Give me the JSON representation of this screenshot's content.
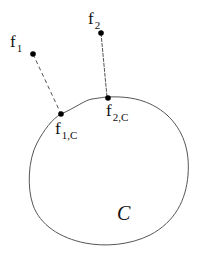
{
  "diagram": {
    "set_label": "C",
    "points": [
      {
        "name": "f",
        "sub": "1",
        "x": 33,
        "y": 54
      },
      {
        "name": "f",
        "sub": "2",
        "x": 101,
        "y": 33
      },
      {
        "name": "f",
        "sub": "1,C",
        "x": 61,
        "y": 114
      },
      {
        "name": "f",
        "sub": "2,C",
        "x": 108,
        "y": 98
      }
    ],
    "connections": [
      {
        "from": "f1",
        "to": "f1,C",
        "style": "dashed"
      },
      {
        "from": "f2",
        "to": "f2,C",
        "style": "dashed"
      }
    ],
    "stroke_color": "#444444"
  }
}
